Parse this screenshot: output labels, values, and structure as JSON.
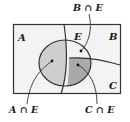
{
  "diagram": {
    "type": "venn",
    "regions": {
      "A": "A",
      "B": "B",
      "C": "C",
      "E": "E"
    },
    "callouts": {
      "a_and_e": "A ∩ E",
      "b_and_e": "B ∩ E",
      "c_and_e": "C ∩ E"
    },
    "colors": {
      "background": "#f4f4f4",
      "border": "#333333",
      "a_and_e_fill": "#cfcfcf",
      "c_and_e_fill": "#a9a9a9",
      "b_and_e_fill": "#f2f2f2"
    }
  }
}
